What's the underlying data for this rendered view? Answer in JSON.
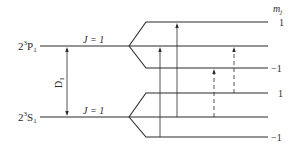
{
  "diagram": {
    "upper_state": {
      "label_main": "2",
      "label_sup": "3",
      "label_letter": "P",
      "label_sub": "1",
      "j_label": "J = 1",
      "mj_levels": [
        "1",
        "0",
        "-1"
      ]
    },
    "lower_state": {
      "label_main": "2",
      "label_sup": "3",
      "label_letter": "S",
      "label_sub": "1",
      "j_label": "J = 1",
      "mj_levels": [
        "1",
        "0",
        "-1"
      ]
    },
    "transition_label_main": "D",
    "transition_label_sub": "1",
    "mj_header_main": "m",
    "mj_header_sub": "j",
    "right_labels": [
      {
        "state": "upper",
        "mj": "1",
        "text": "1"
      },
      {
        "state": "upper",
        "mj": "-1",
        "text": "−1"
      },
      {
        "state": "lower",
        "mj": "1",
        "text": "1"
      },
      {
        "state": "lower",
        "mj": "-1",
        "text": "−1"
      }
    ],
    "transitions": [
      {
        "from": "lower:-1",
        "to": "upper:0",
        "style": "solid"
      },
      {
        "from": "lower:0",
        "to": "upper:1",
        "style": "solid"
      },
      {
        "from": "lower:0",
        "to": "upper:-1",
        "style": "dashed"
      },
      {
        "from": "lower:1",
        "to": "upper:0",
        "style": "dashed"
      }
    ]
  }
}
